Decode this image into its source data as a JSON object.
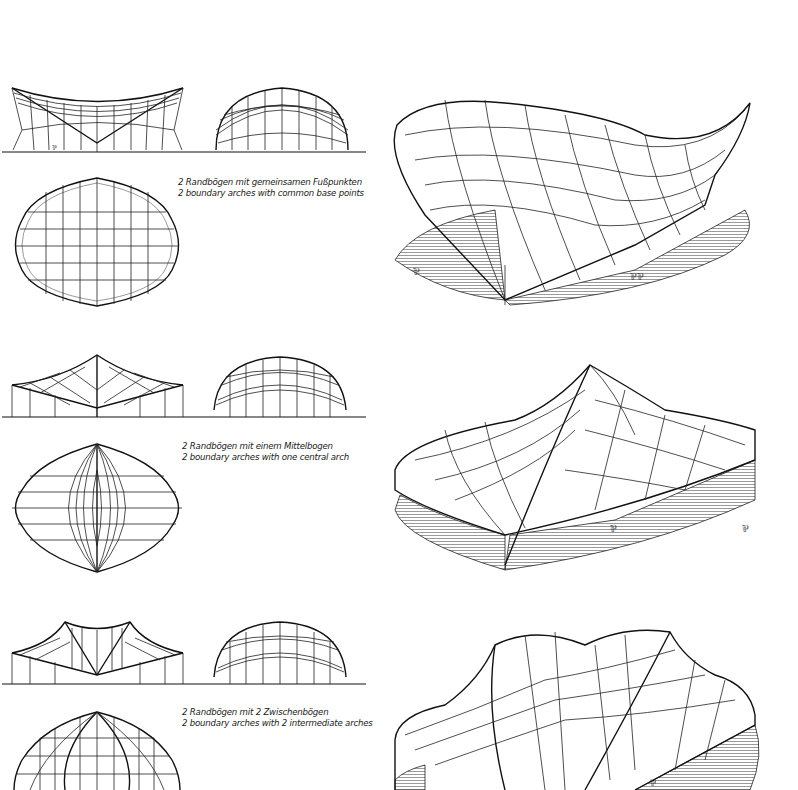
{
  "plate": {
    "rows": [
      {
        "id": "variant-1",
        "caption_de": "2 Randbögen mit gemeinsamen Fußpunkten",
        "caption_en": "2 boundary arches with common base points",
        "views": [
          "side-elevation",
          "front-elevation",
          "plan",
          "perspective"
        ]
      },
      {
        "id": "variant-2",
        "caption_de": "2 Randbögen mit einem Mittelbogen",
        "caption_en": "2 boundary arches with one central arch",
        "views": [
          "side-elevation",
          "front-elevation",
          "plan",
          "perspective"
        ]
      },
      {
        "id": "variant-3",
        "caption_de": "2 Randbögen mit 2 Zwischenbögen",
        "caption_en": "2 boundary arches with 2 intermediate arches",
        "views": [
          "side-elevation",
          "front-elevation",
          "plan",
          "perspective"
        ]
      }
    ]
  },
  "colors": {
    "ink": "#111111",
    "paper": "#ffffff",
    "hatch": "#555555"
  }
}
